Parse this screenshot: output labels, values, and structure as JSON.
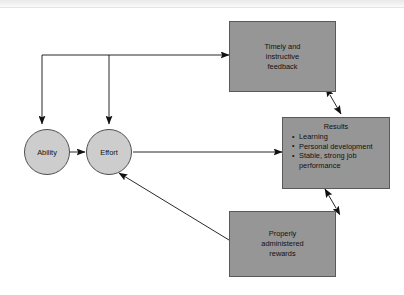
{
  "diagram": {
    "colors": {
      "box_fill": "#969696",
      "box_stroke": "#5a5a5a",
      "circle_fill": "#cdcdcd",
      "circle_stroke": "#4f4f4f",
      "arrow": "#111111",
      "background": "#ffffff"
    },
    "nodes": {
      "ability": {
        "label": "Ability",
        "shape": "circle"
      },
      "effort": {
        "label": "Effort",
        "shape": "circle"
      },
      "feedback": {
        "shape": "box",
        "lines": [
          "Timely and",
          "instructive",
          "feedback"
        ]
      },
      "rewards": {
        "shape": "box",
        "lines": [
          "Properly",
          "administered",
          "rewards"
        ]
      },
      "results": {
        "shape": "box",
        "title": "Results",
        "bullets": [
          "Learning",
          "Personal development",
          "Stable, strong job performance"
        ]
      }
    },
    "edges": [
      {
        "from": "ability",
        "to": "effort",
        "style": "single-arrow"
      },
      {
        "from": "effort",
        "to": "results",
        "style": "single-arrow"
      },
      {
        "from": "effort",
        "to": "feedback",
        "style": "single-arrow"
      },
      {
        "from": "feedback",
        "to": "ability",
        "style": "single-arrow"
      },
      {
        "from": "feedback",
        "to": "effort",
        "style": "single-arrow"
      },
      {
        "from": "feedback",
        "to": "results",
        "style": "double-arrow"
      },
      {
        "from": "results",
        "to": "rewards",
        "style": "double-arrow"
      },
      {
        "from": "rewards",
        "to": "effort",
        "style": "single-arrow"
      }
    ]
  }
}
